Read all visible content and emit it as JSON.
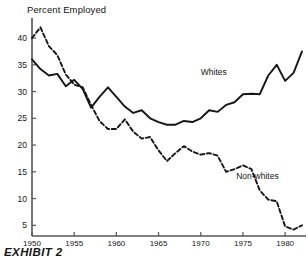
{
  "chart_data": {
    "type": "line",
    "title": "Percent Employed",
    "caption": "EXHIBIT 2",
    "xlabel": "",
    "ylabel": "Percent Employed",
    "xlim": [
      1950,
      1982
    ],
    "ylim": [
      3,
      43
    ],
    "grid": false,
    "legend_position": "inline-annotations",
    "xticks": [
      "1950",
      "1955",
      "1960",
      "1965",
      "1970",
      "1975",
      "1980"
    ],
    "xtick_values": [
      1950,
      1955,
      1960,
      1965,
      1970,
      1975,
      1980
    ],
    "yticks": [
      "5",
      "10",
      "15",
      "20",
      "25",
      "30",
      "35",
      "40"
    ],
    "ytick_values": [
      5,
      10,
      15,
      20,
      25,
      30,
      35,
      40
    ],
    "x": [
      1950,
      1951,
      1952,
      1953,
      1954,
      1955,
      1956,
      1957,
      1958,
      1959,
      1960,
      1961,
      1962,
      1963,
      1964,
      1965,
      1966,
      1967,
      1968,
      1969,
      1970,
      1971,
      1972,
      1973,
      1974,
      1975,
      1976,
      1977,
      1978,
      1979,
      1980,
      1981,
      1982
    ],
    "series": [
      {
        "name": "Whites",
        "style": "solid",
        "color": "#161616",
        "label_x": 1970,
        "label_y": 33.5,
        "values": [
          36.0,
          34.2,
          33.0,
          33.3,
          31.0,
          32.2,
          30.5,
          27.0,
          29.0,
          30.8,
          29.0,
          27.2,
          26.0,
          26.5,
          25.0,
          24.3,
          23.8,
          23.8,
          24.5,
          24.3,
          25.0,
          26.5,
          26.2,
          27.5,
          28.0,
          29.5,
          29.6,
          29.5,
          33.0,
          35.0,
          32.0,
          33.5,
          37.5
        ]
      },
      {
        "name": "Non-whites",
        "style": "dashed",
        "color": "#161616",
        "label_x": 1974.2,
        "label_y": 14.0,
        "values": [
          40.0,
          42.0,
          38.5,
          36.8,
          33.2,
          31.3,
          30.8,
          27.5,
          24.5,
          23.0,
          23.0,
          24.8,
          22.5,
          21.2,
          21.5,
          19.0,
          17.0,
          18.5,
          19.8,
          18.8,
          18.2,
          18.5,
          18.0,
          15.0,
          15.5,
          16.2,
          15.5,
          11.5,
          9.8,
          9.5,
          4.8,
          4.2,
          5.0
        ]
      }
    ]
  }
}
